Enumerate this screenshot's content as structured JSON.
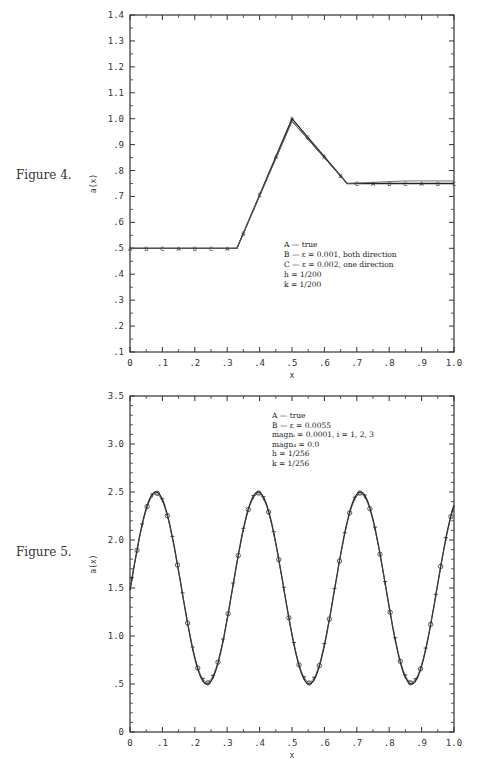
{
  "figures": [
    {
      "label": "Figure 4.",
      "legend": [
        "A — true",
        "B — ε = 0.001, both direction",
        "C — ε = 0.002, one direction",
        "h = 1/200",
        "k = 1/200"
      ]
    },
    {
      "label": "Figure 5.",
      "legend": [
        "A — true",
        "B — ε = 0.0055",
        "magnᵢ = 0.0001,  i = 1, 2, 3",
        "magn₄ = 0.0",
        "h = 1/256",
        "k = 1/256"
      ]
    }
  ],
  "chart_data": [
    {
      "type": "line",
      "title": "Figure 4.",
      "xlabel": "x",
      "ylabel": "a(x)",
      "xlim": [
        0,
        1.0
      ],
      "ylim": [
        0.1,
        1.4
      ],
      "x_ticks": [
        "0",
        ".1",
        ".2",
        ".3",
        ".4",
        ".5",
        ".6",
        ".7",
        ".8",
        ".9",
        "1.0"
      ],
      "y_ticks": [
        ".1",
        ".2",
        ".3",
        ".4",
        ".5",
        ".6",
        ".7",
        ".8",
        ".9",
        "1.0",
        "1.1",
        "1.2",
        "1.3",
        "1.4"
      ],
      "grid": false,
      "legend_position": "center-right",
      "series": [
        {
          "name": "A — true",
          "x": [
            0,
            0.33,
            0.5,
            0.67,
            1.0
          ],
          "y": [
            0.5,
            0.5,
            1.0,
            0.75,
            0.75
          ]
        },
        {
          "name": "B — ε = 0.001, both direction",
          "x": [
            0,
            0.33,
            0.5,
            0.67,
            1.0
          ],
          "y": [
            0.5,
            0.5,
            0.99,
            0.75,
            0.75
          ]
        },
        {
          "name": "C — ε = 0.002, one direction",
          "x": [
            0,
            0.33,
            0.5,
            0.67,
            0.85,
            1.0
          ],
          "y": [
            0.5,
            0.5,
            0.99,
            0.75,
            0.76,
            0.76
          ]
        }
      ],
      "annotations": [
        "h = 1/200",
        "k = 1/200"
      ]
    },
    {
      "type": "line",
      "title": "Figure 5.",
      "xlabel": "x",
      "ylabel": "a(x)",
      "xlim": [
        0,
        1.0
      ],
      "ylim": [
        0,
        3.5
      ],
      "x_ticks": [
        "0",
        ".1",
        ".2",
        ".3",
        ".4",
        ".5",
        ".6",
        ".7",
        ".8",
        ".9",
        "1.0"
      ],
      "y_ticks": [
        "0",
        ".5",
        "1.0",
        "1.5",
        "2.0",
        "2.5",
        "3.0",
        "3.5"
      ],
      "grid": false,
      "legend_position": "top-right",
      "series": [
        {
          "name": "A — true",
          "x": [
            0,
            0.08,
            0.235,
            0.39,
            0.55,
            0.71,
            0.865,
            1.0
          ],
          "y": [
            1.55,
            2.5,
            0.5,
            2.5,
            0.5,
            2.5,
            0.5,
            2.3
          ]
        },
        {
          "name": "B — ε = 0.0055",
          "x": [
            0,
            0.08,
            0.235,
            0.39,
            0.55,
            0.71,
            0.865,
            1.0
          ],
          "y": [
            1.55,
            2.48,
            0.52,
            2.49,
            0.51,
            2.53,
            0.52,
            2.35
          ]
        }
      ],
      "annotations": [
        "magnᵢ = 0.0001,  i = 1, 2, 3",
        "magn₄ = 0.0",
        "h = 1/256",
        "k = 1/256"
      ]
    }
  ]
}
